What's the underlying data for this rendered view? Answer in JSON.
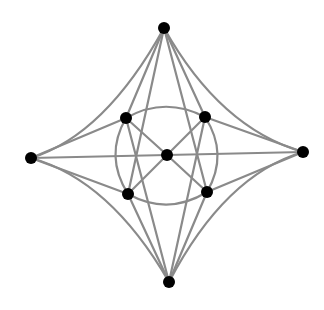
{
  "diagram": {
    "type": "graph",
    "canvas": {
      "width": 324,
      "height": 310,
      "background": "#ffffff"
    },
    "style": {
      "edge_color": "#8a8a8a",
      "node_color": "#000000",
      "node_radius": 6
    },
    "nodes": [
      {
        "id": "top",
        "x": 164,
        "y": 28
      },
      {
        "id": "bottom",
        "x": 169,
        "y": 282
      },
      {
        "id": "left",
        "x": 31,
        "y": 158
      },
      {
        "id": "right",
        "x": 303,
        "y": 152
      },
      {
        "id": "inner-ul",
        "x": 126,
        "y": 118
      },
      {
        "id": "inner-ur",
        "x": 205,
        "y": 117
      },
      {
        "id": "inner-ll",
        "x": 128,
        "y": 194
      },
      {
        "id": "inner-lr",
        "x": 207,
        "y": 192
      },
      {
        "id": "center",
        "x": 167,
        "y": 155
      }
    ],
    "edges": [
      {
        "from": "top",
        "to": "left",
        "shape": "concave-curve",
        "d": "M164,28 Q105,135 31,158"
      },
      {
        "from": "top",
        "to": "right",
        "shape": "concave-curve",
        "d": "M164,28 Q220,128 303,152"
      },
      {
        "from": "bottom",
        "to": "left",
        "shape": "concave-curve",
        "d": "M169,282 Q110,180 31,158"
      },
      {
        "from": "bottom",
        "to": "right",
        "shape": "concave-curve",
        "d": "M169,282 Q225,175 303,152"
      },
      {
        "from": "top",
        "to": "inner-ul",
        "shape": "line",
        "d": "M164,28 L126,118"
      },
      {
        "from": "top",
        "to": "inner-ur",
        "shape": "line",
        "d": "M164,28 L205,117"
      },
      {
        "from": "top",
        "to": "inner-ll",
        "shape": "line",
        "d": "M164,28 L128,194"
      },
      {
        "from": "top",
        "to": "inner-lr",
        "shape": "line",
        "d": "M164,28 L207,192"
      },
      {
        "from": "bottom",
        "to": "inner-ul",
        "shape": "line",
        "d": "M169,282 L126,118"
      },
      {
        "from": "bottom",
        "to": "inner-ur",
        "shape": "line",
        "d": "M169,282 L205,117"
      },
      {
        "from": "bottom",
        "to": "inner-ll",
        "shape": "line",
        "d": "M169,282 L128,194"
      },
      {
        "from": "bottom",
        "to": "inner-lr",
        "shape": "line",
        "d": "M169,282 L207,192"
      },
      {
        "from": "left",
        "to": "inner-ul",
        "shape": "line",
        "d": "M31,158 L126,118"
      },
      {
        "from": "left",
        "to": "inner-ll",
        "shape": "line",
        "d": "M31,158 L128,194"
      },
      {
        "from": "right",
        "to": "inner-ur",
        "shape": "line",
        "d": "M303,152 L205,117"
      },
      {
        "from": "right",
        "to": "inner-lr",
        "shape": "line",
        "d": "M303,152 L207,192"
      },
      {
        "from": "left",
        "to": "right",
        "shape": "line",
        "via": "center",
        "d": "M31,158 L303,152"
      },
      {
        "from": "center",
        "to": "inner-ul",
        "shape": "line",
        "d": "M167,155 L126,118"
      },
      {
        "from": "center",
        "to": "inner-ur",
        "shape": "line",
        "d": "M167,155 L205,117"
      },
      {
        "from": "center",
        "to": "inner-ll",
        "shape": "line",
        "d": "M167,155 L128,194"
      },
      {
        "from": "center",
        "to": "inner-lr",
        "shape": "line",
        "d": "M167,155 L207,192"
      },
      {
        "from": "inner-ul",
        "to": "inner-ur",
        "shape": "arc",
        "d": "M126,118 Q165,96 205,117"
      },
      {
        "from": "inner-ll",
        "to": "inner-lr",
        "shape": "arc",
        "d": "M128,194 Q168,216 207,192"
      },
      {
        "from": "inner-ul",
        "to": "inner-ll",
        "shape": "arc",
        "d": "M126,118 Q104,156 128,194"
      },
      {
        "from": "inner-ur",
        "to": "inner-lr",
        "shape": "arc",
        "d": "M205,117 Q229,154 207,192"
      }
    ]
  }
}
